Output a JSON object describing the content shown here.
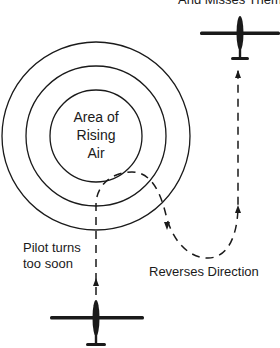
{
  "diagram": {
    "top_caption": "And Misses Them",
    "center_label": [
      "Area of",
      "Rising",
      "Air"
    ],
    "pilot_label": [
      "Pilot turns",
      "too soon"
    ],
    "reverse_label": "Reverses Direction"
  },
  "colors": {
    "ink": "#1a1a1a",
    "background": "#ffffff"
  }
}
